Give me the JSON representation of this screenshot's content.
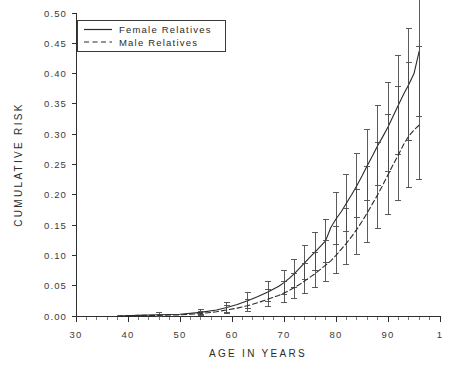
{
  "chart_data": {
    "type": "line",
    "title": "",
    "xlabel": "AGE IN YEARS",
    "ylabel": "CUMULATIVE RISK",
    "xlim": [
      30,
      100
    ],
    "ylim": [
      0.0,
      0.5
    ],
    "xticks": [
      30,
      40,
      50,
      60,
      70,
      80,
      90,
      100
    ],
    "xtick_labels": [
      "30",
      "40",
      "50",
      "60",
      "70",
      "80",
      "90",
      "1"
    ],
    "yticks": [
      0.0,
      0.05,
      0.1,
      0.15,
      0.2,
      0.25,
      0.3,
      0.35,
      0.4,
      0.45,
      0.5
    ],
    "ytick_labels": [
      "0.00",
      "0.05",
      "0.10",
      "0.15",
      "0.20",
      "0.25",
      "0.30",
      "0.35",
      "0.40",
      "0.45",
      "0.50"
    ],
    "grid": false,
    "minor_ticks_x": true,
    "legend_position": "top-left",
    "legend": [
      {
        "label": "Female Relatives",
        "style": "solid"
      },
      {
        "label": "Male Relatives",
        "style": "dashed"
      }
    ],
    "series": [
      {
        "name": "Female Relatives",
        "style": "solid",
        "x": [
          38,
          42,
          46,
          50,
          54,
          57,
          59,
          61,
          63,
          65,
          67,
          69,
          70,
          71,
          72,
          73,
          74,
          75,
          76,
          77,
          78,
          79,
          80,
          81,
          82,
          83,
          84,
          85,
          86,
          87,
          88,
          89,
          90,
          91,
          92,
          93,
          94,
          95,
          96
        ],
        "values": [
          0.0,
          0.001,
          0.002,
          0.003,
          0.006,
          0.01,
          0.014,
          0.019,
          0.025,
          0.032,
          0.04,
          0.049,
          0.055,
          0.062,
          0.07,
          0.079,
          0.088,
          0.097,
          0.106,
          0.115,
          0.124,
          0.146,
          0.16,
          0.172,
          0.186,
          0.2,
          0.215,
          0.231,
          0.248,
          0.264,
          0.281,
          0.296,
          0.312,
          0.33,
          0.348,
          0.366,
          0.382,
          0.4,
          0.437
        ],
        "err_low": [
          0.0,
          0.0,
          0.0,
          0.001,
          0.002,
          0.004,
          0.006,
          0.009,
          0.013,
          0.018,
          0.024,
          0.031,
          0.036,
          0.041,
          0.047,
          0.054,
          0.061,
          0.068,
          0.075,
          0.082,
          0.089,
          0.107,
          0.118,
          0.128,
          0.14,
          0.151,
          0.163,
          0.176,
          0.19,
          0.202,
          0.215,
          0.227,
          0.239,
          0.253,
          0.266,
          0.279,
          0.29,
          0.304,
          0.33
        ],
        "err_high": [
          0.001,
          0.003,
          0.005,
          0.007,
          0.011,
          0.017,
          0.023,
          0.03,
          0.038,
          0.047,
          0.057,
          0.068,
          0.075,
          0.084,
          0.094,
          0.105,
          0.116,
          0.127,
          0.138,
          0.149,
          0.16,
          0.186,
          0.203,
          0.217,
          0.233,
          0.25,
          0.268,
          0.287,
          0.307,
          0.327,
          0.348,
          0.366,
          0.386,
          0.408,
          0.43,
          0.453,
          0.474,
          0.497,
          0.545
        ]
      },
      {
        "name": "Male Relatives",
        "style": "dashed",
        "x": [
          38,
          42,
          46,
          50,
          54,
          57,
          59,
          61,
          63,
          65,
          67,
          69,
          70,
          71,
          72,
          73,
          74,
          75,
          76,
          77,
          78,
          79,
          80,
          81,
          82,
          83,
          84,
          85,
          86,
          87,
          88,
          89,
          90,
          91,
          92,
          93,
          94,
          95,
          96
        ],
        "values": [
          0.0,
          0.001,
          0.001,
          0.002,
          0.004,
          0.007,
          0.01,
          0.013,
          0.017,
          0.022,
          0.028,
          0.034,
          0.038,
          0.042,
          0.047,
          0.052,
          0.058,
          0.064,
          0.07,
          0.077,
          0.084,
          0.091,
          0.1,
          0.11,
          0.12,
          0.131,
          0.143,
          0.156,
          0.17,
          0.185,
          0.2,
          0.216,
          0.233,
          0.25,
          0.266,
          0.283,
          0.297,
          0.307,
          0.315
        ],
        "err_low": [
          0.0,
          0.0,
          0.0,
          0.0,
          0.001,
          0.002,
          0.004,
          0.006,
          0.008,
          0.011,
          0.015,
          0.019,
          0.022,
          0.025,
          0.029,
          0.033,
          0.037,
          0.042,
          0.047,
          0.052,
          0.057,
          0.063,
          0.07,
          0.077,
          0.085,
          0.093,
          0.102,
          0.112,
          0.122,
          0.133,
          0.144,
          0.155,
          0.167,
          0.179,
          0.19,
          0.202,
          0.212,
          0.22,
          0.225
        ],
        "err_high": [
          0.001,
          0.002,
          0.003,
          0.005,
          0.008,
          0.013,
          0.017,
          0.022,
          0.028,
          0.035,
          0.043,
          0.052,
          0.057,
          0.063,
          0.07,
          0.078,
          0.086,
          0.095,
          0.104,
          0.114,
          0.124,
          0.135,
          0.148,
          0.162,
          0.177,
          0.192,
          0.209,
          0.227,
          0.246,
          0.266,
          0.287,
          0.309,
          0.332,
          0.356,
          0.378,
          0.4,
          0.419,
          0.433,
          0.445
        ]
      }
    ]
  },
  "axes": {
    "y_title": "CUMULATIVE RISK",
    "x_title": "AGE IN YEARS"
  }
}
